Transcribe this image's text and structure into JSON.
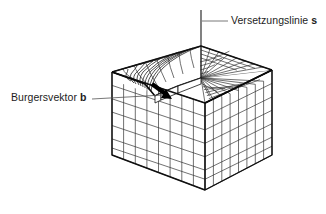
{
  "figure": {
    "title_visible": false,
    "type": "technical-line-diagram",
    "colors": {
      "background": "#ffffff",
      "line": "#1a1a1a",
      "grid_light": "#4a4a4a",
      "text": "#1c1c1c",
      "emphasis": "#000000"
    },
    "labels": [
      {
        "id": "dislocation-line",
        "text": "Versetzungslinie",
        "symbol": "s",
        "leader": "horizontal line from label left edge to the vertical dislocation line"
      },
      {
        "id": "burgers-vector",
        "text": "Burgersvektor",
        "symbol": "b",
        "leader": "near-horizontal line from label right edge to the step arrow on the top face"
      }
    ],
    "annotations": {
      "vertical_line_label": "Versetzungslinie s",
      "arrow_label": "Burgersvektor b"
    },
    "geometry": {
      "block_corners": {
        "top_left": [
          112,
          72
        ],
        "top_back": [
          201,
          46
        ],
        "top_right": [
          272,
          70
        ],
        "top_front": [
          205,
          103
        ],
        "bottom_left": [
          112,
          155
        ],
        "bottom_front": [
          205,
          190
        ],
        "bottom_right": [
          272,
          155
        ]
      },
      "grid_divisions_u": 8,
      "grid_divisions_v": 8,
      "grid_divisions_depth": 6,
      "dislocation_line": {
        "x": 201,
        "y_top": 10,
        "y_base": 78
      }
    }
  }
}
